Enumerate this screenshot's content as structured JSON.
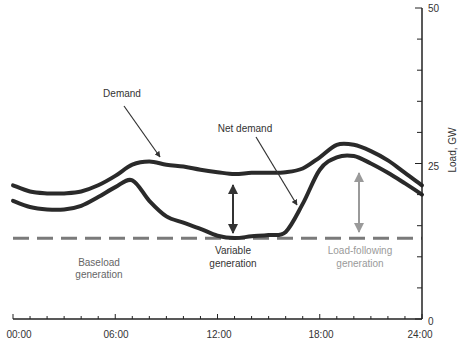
{
  "chart_data": {
    "type": "line",
    "title": "",
    "xlabel": "",
    "ylabel": "Load, GW",
    "xlim": [
      0,
      24
    ],
    "ylim": [
      0,
      50
    ],
    "x_tick_labels": [
      "00:00",
      "06:00",
      "12:00",
      "18:00",
      "24:00"
    ],
    "y_tick_labels": [
      "0",
      "25",
      "50"
    ],
    "x_minor_ticks_per_hour": 1,
    "y_minor_tick_step": 5,
    "grid": false,
    "axis_position": {
      "y": "right",
      "x": "bottom"
    },
    "series": [
      {
        "name": "Demand",
        "style": "solid-thick",
        "color": "#2a2a2a",
        "x": [
          0,
          1,
          2,
          3,
          4,
          5,
          6,
          7,
          8,
          9,
          10,
          11,
          12,
          13,
          14,
          15,
          16,
          17,
          18,
          19,
          20,
          21,
          22,
          23,
          24
        ],
        "values": [
          21.5,
          20.5,
          20.2,
          20.2,
          20.5,
          21.5,
          23.0,
          24.8,
          25.3,
          24.8,
          24.5,
          24.0,
          23.6,
          23.3,
          23.5,
          23.5,
          23.6,
          24.2,
          26.0,
          28.0,
          28.0,
          27.0,
          25.5,
          23.5,
          21.5
        ]
      },
      {
        "name": "Net demand",
        "style": "solid-thick",
        "color": "#2a2a2a",
        "x": [
          0,
          1,
          2,
          3,
          4,
          5,
          6,
          7,
          8,
          9,
          10,
          11,
          12,
          13,
          14,
          15,
          16,
          17,
          18,
          19,
          20,
          21,
          22,
          23,
          24
        ],
        "values": [
          19.0,
          18.0,
          17.6,
          17.6,
          18.2,
          19.6,
          21.2,
          22.3,
          19.0,
          16.5,
          15.5,
          14.5,
          13.4,
          13.0,
          13.3,
          13.5,
          14.0,
          18.5,
          24.0,
          26.0,
          26.2,
          25.0,
          23.5,
          21.8,
          20.0
        ]
      },
      {
        "name": "Baseload",
        "style": "dashed",
        "color": "#7a7a7a",
        "x": [
          0,
          24
        ],
        "values": [
          13.0,
          13.0
        ]
      }
    ],
    "annotations": [
      {
        "text": "Demand",
        "arrow_to": {
          "x": 8.4,
          "y": 25.2
        }
      },
      {
        "text": "Net demand",
        "arrow_to": {
          "x": 16.3,
          "y": 15.5
        }
      },
      {
        "text": "Baseload generation",
        "region": "below dashed line"
      },
      {
        "text": "Variable generation",
        "double_arrow": {
          "x": 12.6,
          "from": 13.0,
          "to": 23.3
        }
      },
      {
        "text": "Load-following generation",
        "double_arrow": {
          "x": 18.8,
          "from": 13.5,
          "to": 24.5
        },
        "color": "#9a9a9a"
      }
    ]
  },
  "labels": {
    "ylabel": "Load, GW",
    "demand": "Demand",
    "net_demand": "Net demand",
    "baseload_line1": "Baseload",
    "baseload_line2": "generation",
    "variable_line1": "Variable",
    "variable_line2": "generation",
    "loadfollow_line1": "Load-following",
    "loadfollow_line2": "generation",
    "x_ticks": [
      "00:00",
      "06:00",
      "12:00",
      "18:00",
      "24:00"
    ],
    "y_ticks": [
      "0",
      "25",
      "50"
    ]
  },
  "colors": {
    "curve": "#2a2a2a",
    "axis": "#222222",
    "baseload_dash": "#7a7a7a",
    "text_dark": "#333333",
    "text_gray": "#666666",
    "load_following": "#9a9a9a"
  }
}
